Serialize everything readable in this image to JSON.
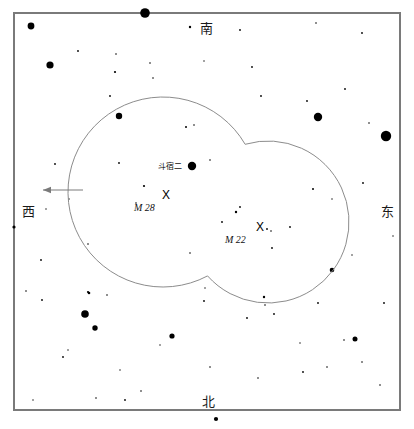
{
  "chart_data": {
    "type": "scatter",
    "title": "",
    "xlabel": "",
    "ylabel": "",
    "grid": false,
    "legend_position": "none",
    "xlim": [
      0,
      414
    ],
    "ylim": [
      0,
      429
    ],
    "frame": {
      "x": 14,
      "y": 13,
      "width": 386,
      "height": 397,
      "stroke": "#7a7a7a",
      "stroke_width": 2
    },
    "direction_labels": [
      {
        "name": "south",
        "text": "南",
        "x": 200,
        "y": 22
      },
      {
        "name": "west",
        "text": "西",
        "x": 22,
        "y": 205
      },
      {
        "name": "east",
        "text": "东",
        "x": 381,
        "y": 205
      },
      {
        "name": "north",
        "text": "北",
        "x": 202,
        "y": 395
      }
    ],
    "field_of_view_circles": [
      {
        "name": "western-fov-circle",
        "cx": 163,
        "cy": 192,
        "r": 95,
        "stroke": "#8c8c8c",
        "stroke_width": 1
      },
      {
        "name": "eastern-fov-circle",
        "cx": 268,
        "cy": 222,
        "r": 81,
        "stroke": "#8c8c8c",
        "stroke_width": 1
      }
    ],
    "direction_arrow": {
      "name": "west-pointing-arrow",
      "x1": 83,
      "y1": 190,
      "x2": 43,
      "y2": 190,
      "stroke": "#7a7a7a",
      "stroke_width": 1
    },
    "deep_sky_objects": [
      {
        "name": "M 28",
        "label": "M 28",
        "marker": "X",
        "marker_x": 162,
        "marker_y": 189,
        "label_x": 134,
        "label_y": 203
      },
      {
        "name": "M 22",
        "label": "M 22",
        "marker": "X",
        "marker_x": 256,
        "marker_y": 221,
        "label_x": 225,
        "label_y": 235
      }
    ],
    "named_stars": [
      {
        "name": "斗宿二",
        "label": "斗宿二",
        "label_x": 158,
        "label_y": 163,
        "star_x": 192,
        "star_y": 166,
        "magnitude_r": 4.2
      }
    ],
    "stars": [
      {
        "x": 31,
        "y": 26,
        "r": 3.4
      },
      {
        "x": 145,
        "y": 13,
        "r": 4.8
      },
      {
        "x": 50,
        "y": 65,
        "r": 3.6
      },
      {
        "x": 318,
        "y": 117,
        "r": 4.2
      },
      {
        "x": 386,
        "y": 136,
        "r": 5.2
      },
      {
        "x": 119,
        "y": 116,
        "r": 3.2
      },
      {
        "x": 192,
        "y": 166,
        "r": 4.2
      },
      {
        "x": 332,
        "y": 270,
        "r": 2.3
      },
      {
        "x": 85,
        "y": 314,
        "r": 3.8
      },
      {
        "x": 95,
        "y": 328,
        "r": 2.7
      },
      {
        "x": 172,
        "y": 336,
        "r": 2.6
      },
      {
        "x": 355,
        "y": 339,
        "r": 2.5
      },
      {
        "x": 216,
        "y": 419,
        "r": 2.1
      },
      {
        "x": 14,
        "y": 227,
        "r": 1.6
      },
      {
        "x": 89,
        "y": 293,
        "r": 1.3
      },
      {
        "x": 264,
        "y": 297,
        "r": 1.2
      },
      {
        "x": 88,
        "y": 292,
        "r": 1.1
      },
      {
        "x": 190,
        "y": 27,
        "r": 1.2
      },
      {
        "x": 240,
        "y": 30,
        "r": 0.9
      },
      {
        "x": 316,
        "y": 23,
        "r": 0.8
      },
      {
        "x": 362,
        "y": 33,
        "r": 0.9
      },
      {
        "x": 78,
        "y": 51,
        "r": 0.9
      },
      {
        "x": 115,
        "y": 72,
        "r": 1.1
      },
      {
        "x": 116,
        "y": 54,
        "r": 0.8
      },
      {
        "x": 150,
        "y": 63,
        "r": 0.8
      },
      {
        "x": 110,
        "y": 96,
        "r": 0.9
      },
      {
        "x": 252,
        "y": 67,
        "r": 0.9
      },
      {
        "x": 261,
        "y": 96,
        "r": 0.9
      },
      {
        "x": 345,
        "y": 89,
        "r": 0.9
      },
      {
        "x": 369,
        "y": 123,
        "r": 0.8
      },
      {
        "x": 186,
        "y": 127,
        "r": 1.0
      },
      {
        "x": 194,
        "y": 125,
        "r": 0.8
      },
      {
        "x": 307,
        "y": 101,
        "r": 0.9
      },
      {
        "x": 153,
        "y": 78,
        "r": 0.8
      },
      {
        "x": 119,
        "y": 163,
        "r": 0.9
      },
      {
        "x": 55,
        "y": 164,
        "r": 0.9
      },
      {
        "x": 144,
        "y": 186,
        "r": 1.1
      },
      {
        "x": 136,
        "y": 203,
        "r": 0.8
      },
      {
        "x": 313,
        "y": 189,
        "r": 1.0
      },
      {
        "x": 210,
        "y": 160,
        "r": 0.8
      },
      {
        "x": 236,
        "y": 212,
        "r": 1.2
      },
      {
        "x": 240,
        "y": 207,
        "r": 0.9
      },
      {
        "x": 267,
        "y": 229,
        "r": 0.9
      },
      {
        "x": 271,
        "y": 231,
        "r": 0.8
      },
      {
        "x": 290,
        "y": 227,
        "r": 0.9
      },
      {
        "x": 272,
        "y": 248,
        "r": 0.9
      },
      {
        "x": 190,
        "y": 253,
        "r": 0.8
      },
      {
        "x": 222,
        "y": 222,
        "r": 0.9
      },
      {
        "x": 363,
        "y": 183,
        "r": 0.9
      },
      {
        "x": 41,
        "y": 260,
        "r": 0.9
      },
      {
        "x": 88,
        "y": 244,
        "r": 0.8
      },
      {
        "x": 42,
        "y": 300,
        "r": 0.9
      },
      {
        "x": 26,
        "y": 291,
        "r": 0.8
      },
      {
        "x": 107,
        "y": 295,
        "r": 0.8
      },
      {
        "x": 204,
        "y": 301,
        "r": 0.9
      },
      {
        "x": 247,
        "y": 318,
        "r": 0.9
      },
      {
        "x": 265,
        "y": 305,
        "r": 0.8
      },
      {
        "x": 274,
        "y": 314,
        "r": 0.9
      },
      {
        "x": 318,
        "y": 303,
        "r": 0.9
      },
      {
        "x": 384,
        "y": 303,
        "r": 0.9
      },
      {
        "x": 344,
        "y": 340,
        "r": 0.8
      },
      {
        "x": 63,
        "y": 357,
        "r": 0.9
      },
      {
        "x": 303,
        "y": 372,
        "r": 0.9
      },
      {
        "x": 327,
        "y": 367,
        "r": 0.8
      },
      {
        "x": 258,
        "y": 378,
        "r": 0.8
      },
      {
        "x": 141,
        "y": 391,
        "r": 0.8
      },
      {
        "x": 96,
        "y": 398,
        "r": 0.8
      },
      {
        "x": 125,
        "y": 400,
        "r": 0.9
      },
      {
        "x": 380,
        "y": 385,
        "r": 0.8
      },
      {
        "x": 362,
        "y": 362,
        "r": 0.8
      },
      {
        "x": 33,
        "y": 400,
        "r": 0.7
      },
      {
        "x": 210,
        "y": 367,
        "r": 0.8
      },
      {
        "x": 160,
        "y": 345,
        "r": 0.7
      },
      {
        "x": 300,
        "y": 343,
        "r": 0.7
      },
      {
        "x": 46,
        "y": 209,
        "r": 0.7
      },
      {
        "x": 68,
        "y": 350,
        "r": 0.7
      },
      {
        "x": 120,
        "y": 370,
        "r": 0.7
      },
      {
        "x": 332,
        "y": 199,
        "r": 0.7
      },
      {
        "x": 393,
        "y": 236,
        "r": 0.7
      },
      {
        "x": 204,
        "y": 61,
        "r": 0.7
      },
      {
        "x": 69,
        "y": 199,
        "r": 0.7
      },
      {
        "x": 205,
        "y": 288,
        "r": 0.7
      },
      {
        "x": 352,
        "y": 255,
        "r": 0.7
      }
    ]
  }
}
